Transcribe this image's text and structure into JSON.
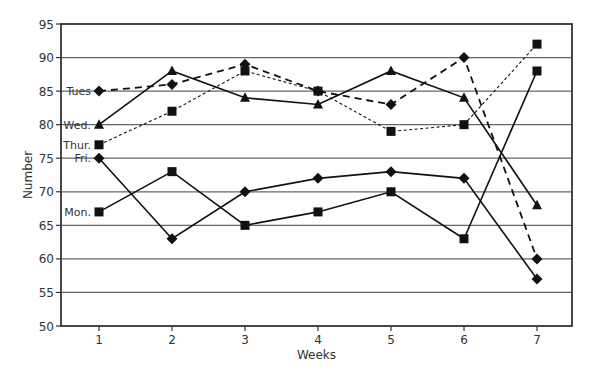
{
  "chart_data": {
    "type": "line",
    "title": "",
    "xlabel": "Weeks",
    "ylabel": "Number",
    "x": [
      1,
      2,
      3,
      4,
      5,
      6,
      7
    ],
    "ylim": [
      50,
      95
    ],
    "yticks": [
      50,
      55,
      60,
      65,
      70,
      75,
      80,
      85,
      90,
      95
    ],
    "grid": "horizontal",
    "legend_position": "inline labels at week 1",
    "series": [
      {
        "name": "Mon.",
        "label": "Mon.",
        "marker": "square",
        "line": "solid",
        "values": [
          67,
          73,
          65,
          67,
          70,
          63,
          88
        ]
      },
      {
        "name": "Tues",
        "label": "Tues",
        "marker": "diamond",
        "line": "dashed",
        "values": [
          85,
          86,
          89,
          85,
          83,
          90,
          60
        ]
      },
      {
        "name": "Wed.",
        "label": "Wed.",
        "marker": "triangle",
        "line": "solid",
        "values": [
          80,
          88,
          84,
          83,
          88,
          84,
          68
        ]
      },
      {
        "name": "Thur.",
        "label": "Thur.",
        "marker": "square",
        "line": "dotted",
        "values": [
          77,
          82,
          88,
          85,
          79,
          80,
          92
        ]
      },
      {
        "name": "Fri.",
        "label": "Fri.",
        "marker": "diamond",
        "line": "solid",
        "values": [
          75,
          63,
          70,
          72,
          73,
          72,
          57
        ]
      }
    ]
  }
}
